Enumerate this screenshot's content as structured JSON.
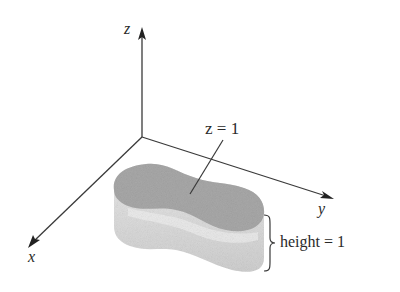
{
  "figure": {
    "axes": {
      "z_label": "z",
      "y_label": "y",
      "x_label": "x"
    },
    "annotations": {
      "top_surface": "z = 1",
      "height": "height = 1"
    },
    "colors": {
      "axis": "#3a3a3a",
      "top_face": "#a9a9a9",
      "side_face": "#d6d6d6",
      "highlight": "#ececec",
      "text": "#2a2a2a"
    }
  }
}
